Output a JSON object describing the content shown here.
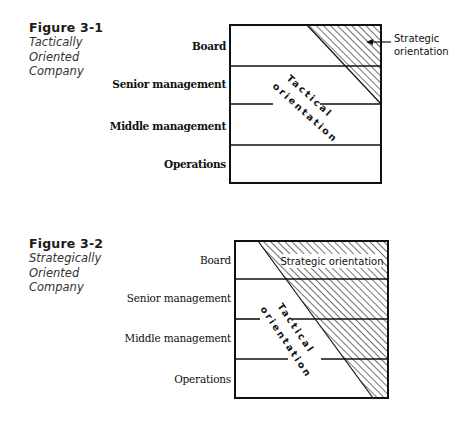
{
  "figures": [
    {
      "number": "Figure 3-1",
      "subtitle_lines": [
        "Tactically",
        "Oriented",
        "Company"
      ],
      "levels": [
        "Board",
        "Senior management",
        "Middle management",
        "Operations"
      ],
      "tactical_label": [
        "Tactical",
        "orientation"
      ],
      "strategic_label": [
        "Strategic",
        "orientation"
      ]
    },
    {
      "number": "Figure 3-2",
      "subtitle_lines": [
        "Strategically",
        "Oriented",
        "Company"
      ],
      "levels": [
        "Board",
        "Senior management",
        "Middle management",
        "Operations"
      ],
      "tactical_label": [
        "Tactical",
        "orientation"
      ],
      "strategic_label": "Strategic orientation"
    }
  ]
}
